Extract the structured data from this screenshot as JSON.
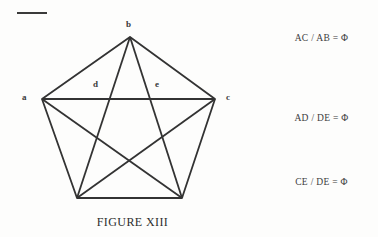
{
  "figure": {
    "caption": "FIGURE XIII",
    "top_rule_icon": "horizontal-rule",
    "line_color": "#333333",
    "background_color": "#fdfdfc",
    "vertex_labels": [
      {
        "id": "b",
        "text": "b",
        "position": "top"
      },
      {
        "id": "a",
        "text": "a",
        "position": "left"
      },
      {
        "id": "c",
        "text": "c",
        "position": "right"
      }
    ],
    "interior_labels": [
      {
        "id": "d",
        "text": "d",
        "position": "inner-left"
      },
      {
        "id": "e",
        "text": "e",
        "position": "inner-right"
      }
    ],
    "shape": {
      "type": "pentagon-with-pentagram",
      "sides": 5,
      "diagonals": 5,
      "points": [
        {
          "name": "b",
          "x": 130,
          "y": 37
        },
        {
          "name": "c",
          "x": 215,
          "y": 99
        },
        {
          "name": "bottom-right",
          "x": 182,
          "y": 198
        },
        {
          "name": "bottom-left",
          "x": 77,
          "y": 198
        },
        {
          "name": "a",
          "x": 42,
          "y": 99
        }
      ]
    }
  },
  "equations": [
    {
      "id": "eq-ac-ab",
      "text": "AC / AB = Φ"
    },
    {
      "id": "eq-ad-de",
      "text": "AD / DE = Φ"
    },
    {
      "id": "eq-ce-de",
      "text": "CE / DE = Φ"
    }
  ]
}
